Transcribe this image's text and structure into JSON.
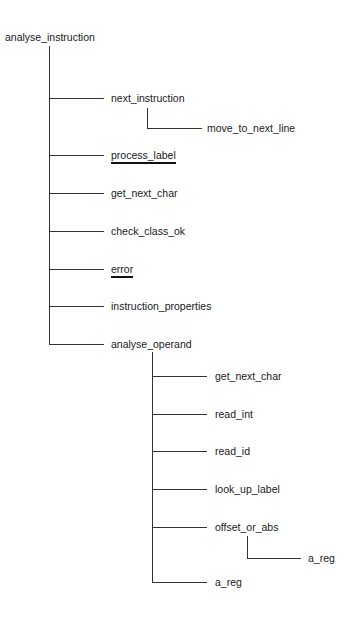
{
  "diagram": {
    "type": "call-tree",
    "root": "analyse_instruction",
    "nodes": [
      {
        "id": "n0",
        "label": "analyse_instruction",
        "level": 0,
        "x": 5,
        "y": 31,
        "underlined": false
      },
      {
        "id": "n1",
        "label": "next_instruction",
        "level": 1,
        "x": 111,
        "y": 92,
        "underlined": false,
        "parent": "n0"
      },
      {
        "id": "n2",
        "label": "move_to_next_line",
        "level": 2,
        "x": 207,
        "y": 122,
        "underlined": false,
        "parent": "n1"
      },
      {
        "id": "n3",
        "label": "process_label",
        "level": 1,
        "x": 111,
        "y": 149,
        "underlined": true,
        "parent": "n0"
      },
      {
        "id": "n4",
        "label": "get_next_char",
        "level": 1,
        "x": 111,
        "y": 187,
        "underlined": false,
        "parent": "n0"
      },
      {
        "id": "n5",
        "label": "check_class_ok",
        "level": 1,
        "x": 111,
        "y": 225,
        "underlined": false,
        "parent": "n0"
      },
      {
        "id": "n6",
        "label": "error",
        "level": 1,
        "x": 111,
        "y": 263,
        "underlined": true,
        "parent": "n0"
      },
      {
        "id": "n7",
        "label": "instruction_properties",
        "level": 1,
        "x": 111,
        "y": 300,
        "underlined": false,
        "parent": "n0"
      },
      {
        "id": "n8",
        "label": "analyse_operand",
        "level": 1,
        "x": 111,
        "y": 338,
        "underlined": false,
        "parent": "n0"
      },
      {
        "id": "n9",
        "label": "get_next_char",
        "level": 2,
        "x": 215,
        "y": 370,
        "underlined": false,
        "parent": "n8"
      },
      {
        "id": "n10",
        "label": "read_int",
        "level": 2,
        "x": 215,
        "y": 408,
        "underlined": false,
        "parent": "n8"
      },
      {
        "id": "n11",
        "label": "read_id",
        "level": 2,
        "x": 215,
        "y": 445,
        "underlined": false,
        "parent": "n8"
      },
      {
        "id": "n12",
        "label": "look_up_label",
        "level": 2,
        "x": 215,
        "y": 483,
        "underlined": false,
        "parent": "n8"
      },
      {
        "id": "n13",
        "label": "offset_or_abs",
        "level": 2,
        "x": 215,
        "y": 521,
        "underlined": false,
        "parent": "n8"
      },
      {
        "id": "n14",
        "label": "a_reg",
        "level": 3,
        "x": 308,
        "y": 552,
        "underlined": false,
        "parent": "n13"
      },
      {
        "id": "n15",
        "label": "a_reg",
        "level": 2,
        "x": 215,
        "y": 576,
        "underlined": false,
        "parent": "n8"
      }
    ],
    "colors": {
      "line": "#333333",
      "text": "#1a1a1a",
      "background": "#ffffff"
    }
  }
}
